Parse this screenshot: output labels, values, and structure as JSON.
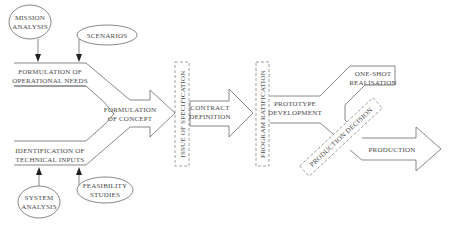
{
  "diagram": {
    "type": "process-flow",
    "inputs_top": [
      {
        "id": "mission-analysis",
        "lines": [
          "MISSION",
          "ANALYSIS"
        ]
      },
      {
        "id": "scenarios",
        "lines": [
          "SCENARIOS"
        ]
      }
    ],
    "inputs_bottom": [
      {
        "id": "system-analysis",
        "lines": [
          "SYSTEM",
          "ANALYSIS"
        ]
      },
      {
        "id": "feasibility-studies",
        "lines": [
          "FEASIBILITY",
          "STUDIES"
        ]
      }
    ],
    "branches": {
      "top": {
        "lines": [
          "FORMULATION OF",
          "OPERATIONAL NEEDS"
        ]
      },
      "bottom": {
        "lines": [
          "IDENTIFICATION OF",
          "TECHNICAL INPUTS"
        ]
      }
    },
    "stages": [
      {
        "id": "formulation-of-concept",
        "lines": [
          "FORMULATION",
          "OF CONCEPT"
        ]
      },
      {
        "id": "contract-definition",
        "lines": [
          "CONTRACT",
          "DEFINITION"
        ]
      },
      {
        "id": "prototype-development",
        "lines": [
          "PROTOTYPE",
          "DEVELOPMENT"
        ]
      }
    ],
    "milestones": [
      {
        "id": "issue-of-specification",
        "label": "ISSUE OF SPECIFICATION"
      },
      {
        "id": "program-ratification",
        "label": "PROGRAM RATIFICATION"
      },
      {
        "id": "production-decision",
        "label": "PRODUCTION DECISION"
      }
    ],
    "outcomes": [
      {
        "id": "one-shot-realisation",
        "lines": [
          "ONE-SHOT",
          "REALISATION"
        ]
      },
      {
        "id": "production",
        "lines": [
          "PRODUCTION"
        ]
      }
    ],
    "colors": {
      "line": "#6a6a6a",
      "text": "#4a4a4a",
      "background": "#ffffff"
    }
  }
}
